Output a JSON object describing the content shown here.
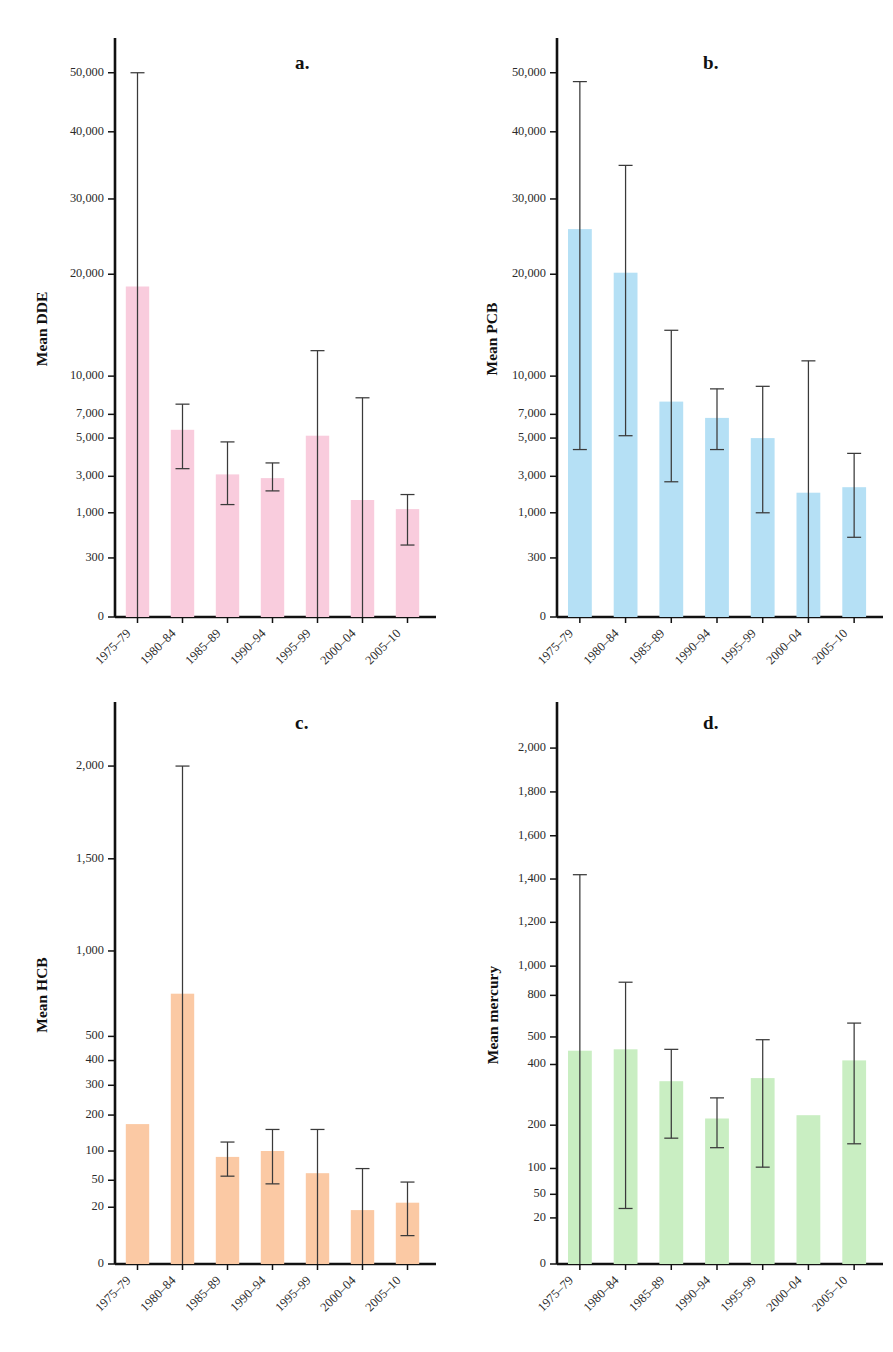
{
  "figure": {
    "categories": [
      "1975–79",
      "1980–84",
      "1985–89",
      "1990–94",
      "1995–99",
      "2000–04",
      "2005–10"
    ],
    "panel_letters": [
      "a.",
      "b.",
      "c.",
      "d."
    ]
  },
  "chart_data": [
    {
      "type": "bar",
      "panel": "a.",
      "title": "",
      "xlabel": "",
      "ylabel": "Mean DDE",
      "categories": [
        "1975–79",
        "1980–84",
        "1985–89",
        "1990–94",
        "1995–99",
        "2000–04",
        "2005–10"
      ],
      "values": [
        18800,
        5700,
        3100,
        2900,
        5200,
        1700,
        1200
      ],
      "error_low": [
        0,
        3400,
        1450,
        2200,
        0,
        0,
        500
      ],
      "error_high": [
        54000,
        7800,
        4800,
        3700,
        12500,
        8300,
        2000
      ],
      "ytick_labels": [
        "0",
        "300",
        "1,000",
        "3,000",
        "5,000",
        "7,000",
        "10,000",
        "20,000",
        "30,000",
        "40,000",
        "50,000"
      ],
      "ytick_values": [
        0,
        300,
        1000,
        3000,
        5000,
        7000,
        10000,
        20000,
        30000,
        40000,
        50000
      ],
      "grid": false,
      "legend": "none",
      "bar_color": "#f9ccdd"
    },
    {
      "type": "bar",
      "panel": "b.",
      "title": "",
      "xlabel": "",
      "ylabel": "Mean PCB",
      "categories": [
        "1975–79",
        "1980–84",
        "1985–89",
        "1990–94",
        "1995–99",
        "2000–04",
        "2005–10"
      ],
      "values": [
        26000,
        20200,
        8000,
        6700,
        5000,
        2100,
        2400
      ],
      "error_low": [
        4400,
        5200,
        2700,
        4400,
        1000,
        0,
        620
      ],
      "error_high": [
        48500,
        35000,
        14500,
        9000,
        9200,
        11500,
        4200
      ],
      "ytick_labels": [
        "0",
        "300",
        "1,000",
        "3,000",
        "5,000",
        "7,000",
        "10,000",
        "20,000",
        "30,000",
        "40,000",
        "50,000"
      ],
      "ytick_values": [
        0,
        300,
        1000,
        3000,
        5000,
        7000,
        10000,
        20000,
        30000,
        40000,
        50000
      ],
      "grid": false,
      "legend": "none",
      "bar_color": "#b5e0f5"
    },
    {
      "type": "bar",
      "panel": "c.",
      "title": "",
      "xlabel": "",
      "ylabel": "Mean HCB",
      "categories": [
        "1975–79",
        "1980–84",
        "1985–89",
        "1990–94",
        "1995–99",
        "2000–04",
        "2005–10"
      ],
      "values": [
        175,
        750,
        90,
        100,
        62,
        19,
        25
      ],
      "error_low": [
        0,
        0,
        57,
        46,
        0,
        0,
        10
      ],
      "error_high": [
        0,
        2150,
        125,
        160,
        160,
        70,
        48
      ],
      "ytick_labels": [
        "0",
        "20",
        "50",
        "100",
        "200",
        "300",
        "400",
        "500",
        "1,000",
        "1,500",
        "2,000"
      ],
      "ytick_values": [
        0,
        20,
        50,
        100,
        200,
        300,
        400,
        500,
        1000,
        1500,
        2000
      ],
      "grid": false,
      "legend": "none",
      "bar_color": "#fbc9a4"
    },
    {
      "type": "bar",
      "panel": "d.",
      "title": "",
      "xlabel": "",
      "ylabel": "Mean mercury",
      "categories": [
        "1975–79",
        "1980–84",
        "1985–89",
        "1990–94",
        "1995–99",
        "2000–04",
        "2005–10"
      ],
      "values": [
        450,
        455,
        345,
        222,
        355,
        233,
        415
      ],
      "error_low": [
        0,
        32,
        170,
        148,
        103,
        0,
        157
      ],
      "error_high": [
        1420,
        890,
        455,
        290,
        490,
        0,
        600
      ],
      "ytick_labels": [
        "0",
        "20",
        "50",
        "100",
        "200",
        "400",
        "500",
        "800",
        "1,000",
        "1,200",
        "1,400",
        "1,600",
        "1,800",
        "2,000"
      ],
      "ytick_values": [
        0,
        20,
        50,
        100,
        200,
        400,
        500,
        800,
        1000,
        1200,
        1400,
        1600,
        1800,
        2000
      ],
      "grid": false,
      "legend": "none",
      "bar_color": "#c9eec2"
    }
  ]
}
